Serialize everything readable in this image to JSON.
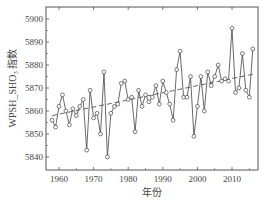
{
  "chart_data": {
    "type": "line",
    "title": "",
    "xlabel": "年份",
    "ylabel": "WPSH_SHO₃ 指数",
    "xlim": [
      1956,
      2017
    ],
    "ylim": [
      5835,
      5905
    ],
    "x_ticks": [
      1960,
      1970,
      1980,
      1990,
      2000,
      2010
    ],
    "y_ticks": [
      5840,
      5850,
      5860,
      5870,
      5880,
      5890,
      5900
    ],
    "grid": false,
    "legend": null,
    "series": [
      {
        "name": "WPSH_SHO3 index",
        "style": "solid line with open circle markers",
        "x": [
          1958,
          1959,
          1960,
          1961,
          1962,
          1963,
          1964,
          1965,
          1966,
          1967,
          1968,
          1969,
          1970,
          1971,
          1972,
          1973,
          1974,
          1975,
          1976,
          1977,
          1978,
          1979,
          1980,
          1981,
          1982,
          1983,
          1984,
          1985,
          1986,
          1987,
          1988,
          1989,
          1990,
          1991,
          1992,
          1993,
          1994,
          1995,
          1996,
          1997,
          1998,
          1999,
          2000,
          2001,
          2002,
          2003,
          2004,
          2005,
          2006,
          2007,
          2008,
          2009,
          2010,
          2011,
          2012,
          2013,
          2014,
          2015,
          2016
        ],
        "values": [
          5856,
          5853,
          5862,
          5867,
          5860,
          5854,
          5861,
          5858,
          5862,
          5865,
          5843,
          5869,
          5857,
          5859,
          5850,
          5877,
          5840,
          5859,
          5862,
          5863,
          5872,
          5873,
          5865,
          5866,
          5851,
          5869,
          5862,
          5867,
          5864,
          5866,
          5871,
          5863,
          5873,
          5868,
          5863,
          5856,
          5878,
          5886,
          5866,
          5866,
          5875,
          5849,
          5862,
          5875,
          5860,
          5877,
          5871,
          5875,
          5880,
          5873,
          5874,
          5873,
          5896,
          5868,
          5870,
          5885,
          5869,
          5866,
          5887
        ]
      },
      {
        "name": "Linear trend",
        "style": "dashed line",
        "x": [
          1958,
          2016
        ],
        "values": [
          5858,
          5876
        ]
      }
    ]
  }
}
